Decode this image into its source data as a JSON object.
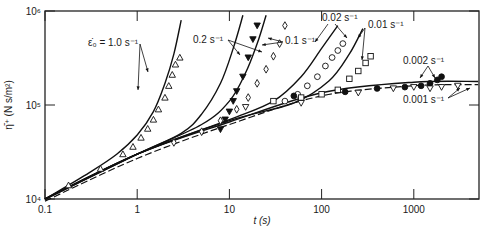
{
  "chart_data": {
    "type": "line",
    "title": "",
    "xlabel": "t (s)",
    "ylabel": "η̄⁺ (N s/m²)",
    "xscale": "log",
    "yscale": "log",
    "xlim": [
      0.1,
      5000
    ],
    "ylim": [
      10000,
      1000000
    ],
    "grid": false,
    "legend_position": "inline annotations",
    "x_ticks": [
      {
        "value": 0.1,
        "label": "0.1"
      },
      {
        "value": 1,
        "label": "1"
      },
      {
        "value": 10,
        "label": "10"
      },
      {
        "value": 100,
        "label": "100"
      },
      {
        "value": 1000,
        "label": "1000"
      }
    ],
    "y_ticks": [
      {
        "value": 10000,
        "label": "10⁴"
      },
      {
        "value": 100000,
        "label": "10⁵"
      },
      {
        "value": 1000000,
        "label": "10⁶"
      }
    ],
    "annotations": [
      {
        "text": "ε̇₀ = 1.0 s⁻¹",
        "rate": 1.0
      },
      {
        "text": "0.2 s⁻¹",
        "rate": 0.2
      },
      {
        "text": "0.1 s⁻¹",
        "rate": 0.1
      },
      {
        "text": "0.02 s⁻¹",
        "rate": 0.02
      },
      {
        "text": "0.01 s⁻¹",
        "rate": 0.01
      },
      {
        "text": "0.002 s⁻¹",
        "rate": 0.002
      },
      {
        "text": "0.001 s⁻¹",
        "rate": 0.001
      }
    ],
    "series": [
      {
        "name": "theory 1.0 s⁻¹",
        "style": "solid",
        "x": [
          0.1,
          0.3,
          0.6,
          1.0,
          1.5,
          2.0,
          2.5,
          3.0
        ],
        "y": [
          10000,
          19000,
          30000,
          48000,
          85000,
          170000,
          350000,
          800000
        ]
      },
      {
        "name": "theory 0.2 s⁻¹",
        "style": "solid",
        "x": [
          0.1,
          1,
          3,
          5,
          8,
          11,
          14
        ],
        "y": [
          10000,
          30000,
          50000,
          80000,
          170000,
          400000,
          900000
        ]
      },
      {
        "name": "theory 0.1 s⁻¹",
        "style": "solid",
        "x": [
          0.1,
          1,
          5,
          10,
          15,
          20,
          25
        ],
        "y": [
          10000,
          30000,
          62000,
          110000,
          220000,
          450000,
          900000
        ]
      },
      {
        "name": "theory 0.02 s⁻¹",
        "style": "solid",
        "x": [
          0.1,
          1,
          10,
          30,
          60,
          100,
          150
        ],
        "y": [
          10000,
          30000,
          70000,
          110000,
          200000,
          400000,
          700000
        ]
      },
      {
        "name": "theory 0.01 s⁻¹",
        "style": "solid",
        "x": [
          0.1,
          1,
          10,
          50,
          120,
          200,
          280
        ],
        "y": [
          10000,
          30000,
          68000,
          105000,
          180000,
          350000,
          650000
        ]
      },
      {
        "name": "theory 0.002/0.001 s⁻¹",
        "style": "solid",
        "x": [
          0.1,
          1,
          10,
          100,
          1000,
          5000
        ],
        "y": [
          10000,
          30000,
          66000,
          135000,
          175000,
          178000
        ]
      },
      {
        "name": "linear viscoelastic 3η⁺",
        "style": "dashed",
        "x": [
          0.1,
          1,
          10,
          100,
          1000,
          5000
        ],
        "y": [
          9500,
          27000,
          62000,
          125000,
          160000,
          165000
        ]
      },
      {
        "name": "data 1.0 s⁻¹",
        "marker": "triangle-up-open",
        "x": [
          0.18,
          0.4,
          0.7,
          0.9,
          1.1,
          1.3,
          1.5,
          1.7,
          2.0,
          2.2,
          2.4,
          2.6,
          2.9
        ],
        "y": [
          14000,
          21000,
          30000,
          36000,
          45000,
          56000,
          70000,
          90000,
          120000,
          160000,
          210000,
          270000,
          320000
        ]
      },
      {
        "name": "data 0.2 s⁻¹",
        "marker": "triangle-down-filled",
        "x": [
          8,
          9,
          10,
          11,
          12,
          14,
          16,
          18,
          20
        ],
        "y": [
          55000,
          70000,
          85000,
          110000,
          140000,
          200000,
          320000,
          500000,
          700000
        ]
      },
      {
        "name": "data 0.1 s⁻¹",
        "marker": "diamond-open",
        "x": [
          2.5,
          5,
          8,
          12,
          16,
          20,
          25,
          30,
          35,
          40
        ],
        "y": [
          40000,
          52000,
          68000,
          90000,
          120000,
          170000,
          240000,
          330000,
          450000,
          700000
        ]
      },
      {
        "name": "data 0.02 s⁻¹",
        "marker": "circle-open",
        "x": [
          40,
          55,
          70,
          90,
          110,
          130,
          150,
          170
        ],
        "y": [
          110000,
          130000,
          160000,
          200000,
          260000,
          320000,
          380000,
          450000
        ]
      },
      {
        "name": "data 0.01 s⁻¹",
        "marker": "square-open",
        "x": [
          30,
          60,
          100,
          150,
          200,
          250,
          300,
          340
        ],
        "y": [
          110000,
          120000,
          130000,
          145000,
          190000,
          230000,
          280000,
          330000
        ]
      },
      {
        "name": "data 0.002 s⁻¹",
        "marker": "circle-filled",
        "x": [
          50,
          180,
          400,
          800,
          1200,
          1500,
          1800,
          2000
        ],
        "y": [
          125000,
          138000,
          150000,
          155000,
          160000,
          170000,
          185000,
          200000
        ]
      },
      {
        "name": "data 0.001 s⁻¹",
        "marker": "triangle-down-open",
        "x": [
          15,
          60,
          250,
          600,
          1000,
          1500,
          2000,
          3000
        ],
        "y": [
          95000,
          105000,
          135000,
          150000,
          155000,
          150000,
          155000,
          160000
        ]
      }
    ]
  }
}
